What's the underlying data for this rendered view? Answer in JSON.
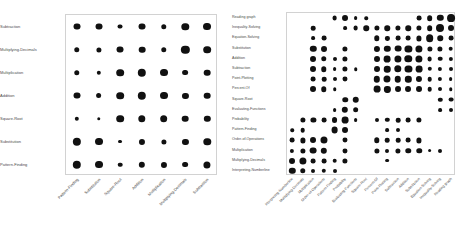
{
  "figure": {
    "background_color": "#ffffff",
    "dot_color": "#111111",
    "frame_color": "#d2d2d2",
    "panel_count": 2
  },
  "chart_data": [
    {
      "id": "left-matrix",
      "type": "heatmap",
      "title": "",
      "subtitle": "",
      "xlabel": "",
      "ylabel": "",
      "grid": false,
      "legend": "none",
      "marker": "circle",
      "encoding": "dot area encodes value",
      "x_categories": [
        "Pattern-Finding",
        "Substitution",
        "Square-Root",
        "Addition",
        "Multiplication",
        "Multiplying-Decimals",
        "Subtraction"
      ],
      "y_categories": [
        "Subtraction",
        "Multiplying-Decimals",
        "Multiplication",
        "Addition",
        "Square-Root",
        "Substitution",
        "Pattern-Finding"
      ],
      "values": [
        [
          0.55,
          0.55,
          0.28,
          0.55,
          0.34,
          0.62,
          0.72
        ],
        [
          0.34,
          0.3,
          0.55,
          0.5,
          0.34,
          0.78,
          0.66
        ],
        [
          0.34,
          0.22,
          0.66,
          0.8,
          0.72,
          0.38,
          0.5
        ],
        [
          0.55,
          0.38,
          0.66,
          0.8,
          0.72,
          0.42,
          0.5
        ],
        [
          0.22,
          0.14,
          0.66,
          0.62,
          0.66,
          0.5,
          0.46
        ],
        [
          0.78,
          0.72,
          0.18,
          0.42,
          0.3,
          0.42,
          0.62
        ],
        [
          0.8,
          0.72,
          0.24,
          0.46,
          0.42,
          0.38,
          0.58
        ]
      ]
    },
    {
      "id": "right-matrix",
      "type": "heatmap",
      "title": "",
      "subtitle": "",
      "xlabel": "",
      "ylabel": "",
      "grid": false,
      "legend": "none",
      "marker": "circle",
      "encoding": "dot area encodes value",
      "x_categories": [
        "Interpreting-Numberline",
        "Multiplying-Decimals",
        "Multiplication",
        "Order-of-Operations",
        "Pattern-Finding",
        "Probability",
        "Evaluating-Functions",
        "Square-Root",
        "Percent-Of",
        "Point-Plotting",
        "Subtraction",
        "Addition",
        "Substitution",
        "Equation-Solving",
        "Inequality-Solving",
        "Reading graph"
      ],
      "y_categories": [
        "Reading graph",
        "Inequality-Solving",
        "Equation-Solving",
        "Substitution",
        "Addition",
        "Subtraction",
        "Point-Plotting",
        "Percent-Of",
        "Square-Root",
        "Evaluating-Functions",
        "Probability",
        "Pattern-Finding",
        "Order-of-Operations",
        "Multiplication",
        "Multiplying-Decimals",
        "Interpreting-Numberline"
      ],
      "values": [
        [
          0.0,
          0.0,
          0.0,
          0.0,
          0.26,
          0.4,
          0.16,
          0.14,
          0.0,
          0.0,
          0.0,
          0.0,
          0.26,
          0.36,
          0.46,
          0.7
        ],
        [
          0.0,
          0.0,
          0.24,
          0.0,
          0.0,
          0.16,
          0.26,
          0.34,
          0.3,
          0.34,
          0.3,
          0.34,
          0.3,
          0.36,
          0.72,
          0.4
        ],
        [
          0.0,
          0.0,
          0.16,
          0.26,
          0.0,
          0.0,
          0.0,
          0.0,
          0.34,
          0.2,
          0.26,
          0.26,
          0.3,
          0.66,
          0.34,
          0.26
        ],
        [
          0.0,
          0.0,
          0.46,
          0.4,
          0.0,
          0.3,
          0.0,
          0.0,
          0.42,
          0.46,
          0.52,
          0.58,
          0.58,
          0.3,
          0.3,
          0.24
        ],
        [
          0.0,
          0.0,
          0.4,
          0.34,
          0.18,
          0.3,
          0.0,
          0.0,
          0.4,
          0.52,
          0.58,
          0.62,
          0.58,
          0.26,
          0.24,
          0.2
        ],
        [
          0.0,
          0.0,
          0.4,
          0.34,
          0.16,
          0.3,
          0.14,
          0.0,
          0.4,
          0.48,
          0.62,
          0.56,
          0.52,
          0.22,
          0.2,
          0.18
        ],
        [
          0.0,
          0.0,
          0.26,
          0.24,
          0.18,
          0.28,
          0.0,
          0.0,
          0.46,
          0.56,
          0.48,
          0.46,
          0.42,
          0.24,
          0.2,
          0.16
        ],
        [
          0.0,
          0.0,
          0.4,
          0.34,
          0.14,
          0.0,
          0.0,
          0.0,
          0.52,
          0.44,
          0.4,
          0.4,
          0.4,
          0.24,
          0.18,
          0.14
        ],
        [
          0.0,
          0.0,
          0.0,
          0.0,
          0.0,
          0.34,
          0.48,
          0.0,
          0.0,
          0.0,
          0.0,
          0.0,
          0.0,
          0.0,
          0.22,
          0.26
        ],
        [
          0.0,
          0.0,
          0.0,
          0.0,
          0.16,
          0.46,
          0.36,
          0.0,
          0.0,
          0.0,
          0.0,
          0.0,
          0.0,
          0.0,
          0.16,
          0.18
        ],
        [
          0.0,
          0.3,
          0.3,
          0.26,
          0.4,
          0.52,
          0.16,
          0.0,
          0.18,
          0.22,
          0.24,
          0.26,
          0.3,
          0.0,
          0.0,
          0.0
        ],
        [
          0.14,
          0.24,
          0.0,
          0.0,
          0.52,
          0.4,
          0.0,
          0.0,
          0.0,
          0.16,
          0.18,
          0.0,
          0.0,
          0.0,
          0.0,
          0.0
        ],
        [
          0.26,
          0.3,
          0.4,
          0.56,
          0.0,
          0.28,
          0.0,
          0.0,
          0.34,
          0.24,
          0.24,
          0.26,
          0.3,
          0.0,
          0.0,
          0.0
        ],
        [
          0.2,
          0.3,
          0.52,
          0.46,
          0.0,
          0.28,
          0.0,
          0.0,
          0.3,
          0.18,
          0.3,
          0.34,
          0.34,
          0.16,
          0.18,
          0.0
        ],
        [
          0.4,
          0.58,
          0.26,
          0.26,
          0.24,
          0.3,
          0.0,
          0.0,
          0.0,
          0.16,
          0.0,
          0.0,
          0.0,
          0.0,
          0.0,
          0.0
        ],
        [
          0.46,
          0.34,
          0.18,
          0.22,
          0.18,
          0.0,
          0.0,
          0.0,
          0.0,
          0.0,
          0.0,
          0.0,
          0.0,
          0.0,
          0.0,
          0.0
        ]
      ]
    }
  ]
}
